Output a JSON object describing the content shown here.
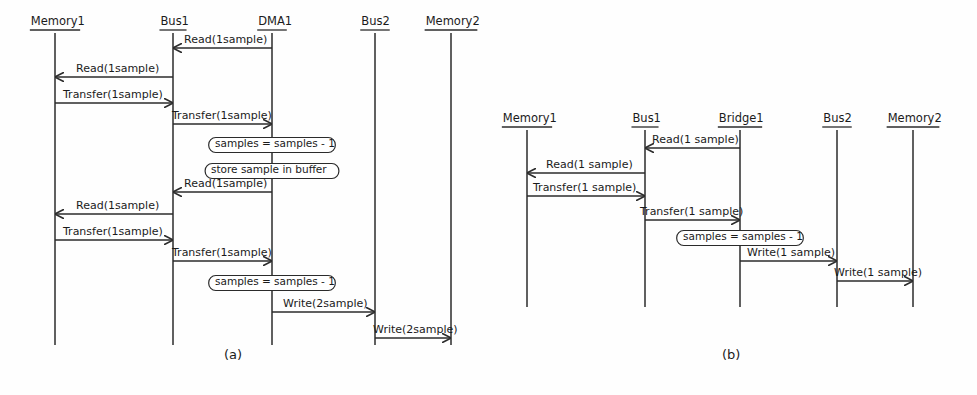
{
  "figure": {
    "caption_a": "(a)",
    "caption_b": "(b)",
    "stroke_color": "#2b2b2b",
    "text_color": "#1b1b1b",
    "background_color": "#fefefe"
  },
  "diagram_a": {
    "name": "(a)",
    "lifelines": [
      {
        "label": "Memory1",
        "x": 55
      },
      {
        "label": "Bus1",
        "x": 173
      },
      {
        "label": "DMA1",
        "x": 272
      },
      {
        "label": "Bus2",
        "x": 375
      },
      {
        "label": "Memory2",
        "x": 451
      }
    ],
    "messages": [
      {
        "label": "Read(1sample)",
        "from": "DMA1",
        "to": "Bus1",
        "y": 48,
        "direction": "left"
      },
      {
        "label": "Read(1sample)",
        "from": "Bus1",
        "to": "Memory1",
        "y": 77,
        "direction": "left"
      },
      {
        "label": "Transfer(1sample)",
        "from": "Memory1",
        "to": "Bus1",
        "y": 103,
        "direction": "right"
      },
      {
        "label": "Transfer(1sample)",
        "from": "Bus1",
        "to": "DMA1",
        "y": 124,
        "direction": "right"
      },
      {
        "label": "Read(1sample)",
        "from": "DMA1",
        "to": "Bus1",
        "y": 192,
        "direction": "left"
      },
      {
        "label": "Read(1sample)",
        "from": "Bus1",
        "to": "Memory1",
        "y": 214,
        "direction": "left"
      },
      {
        "label": "Transfer(1sample)",
        "from": "Memory1",
        "to": "Bus1",
        "y": 240,
        "direction": "right"
      },
      {
        "label": "Transfer(1sample)",
        "from": "Bus1",
        "to": "DMA1",
        "y": 261,
        "direction": "right"
      },
      {
        "label": "Write(2sample)",
        "from": "DMA1",
        "to": "Bus2",
        "y": 312,
        "direction": "right"
      },
      {
        "label": "Write(2sample)",
        "from": "Bus2",
        "to": "Memory2",
        "y": 338,
        "direction": "right"
      }
    ],
    "notes": [
      {
        "label": "samples = samples - 1",
        "cx": 272,
        "y": 145
      },
      {
        "label": "store sample in buffer",
        "cx": 272,
        "y": 171
      },
      {
        "label": "samples = samples - 1",
        "cx": 272,
        "y": 283
      }
    ]
  },
  "diagram_b": {
    "name": "(b)",
    "lifelines": [
      {
        "label": "Memory1",
        "x": 527
      },
      {
        "label": "Bus1",
        "x": 645
      },
      {
        "label": "Bridge1",
        "x": 740
      },
      {
        "label": "Bus2",
        "x": 837
      },
      {
        "label": "Memory2",
        "x": 913
      }
    ],
    "messages": [
      {
        "label": "Read(1 sample)",
        "from": "Bridge1",
        "to": "Bus1",
        "y": 148,
        "direction": "left"
      },
      {
        "label": "Read(1 sample)",
        "from": "Bus1",
        "to": "Memory1",
        "y": 173,
        "direction": "left"
      },
      {
        "label": "Transfer(1 sample)",
        "from": "Memory1",
        "to": "Bus1",
        "y": 196,
        "direction": "right"
      },
      {
        "label": "Transfer(1 sample)",
        "from": "Bus1",
        "to": "Bridge1",
        "y": 220,
        "direction": "right"
      },
      {
        "label": "Write(1 sample)",
        "from": "Bridge1",
        "to": "Bus2",
        "y": 261,
        "direction": "right"
      },
      {
        "label": "Write(1 sample)",
        "from": "Bus2",
        "to": "Memory2",
        "y": 281,
        "direction": "right"
      }
    ],
    "notes": [
      {
        "label": "samples = samples - 1",
        "cx": 740,
        "y": 238
      }
    ]
  }
}
